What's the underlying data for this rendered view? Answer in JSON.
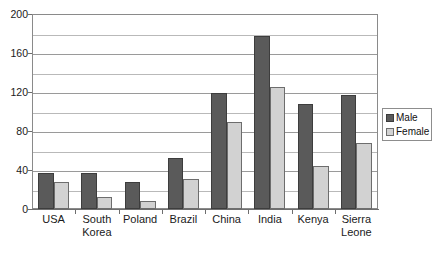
{
  "chart_data": {
    "type": "bar",
    "title": "",
    "subtitle": "",
    "xlabel": "",
    "ylabel": "",
    "ylim": [
      0,
      200
    ],
    "ytick_labels": [
      "0",
      "40",
      "80",
      "120",
      "160",
      "200"
    ],
    "ytick_values": [
      0,
      40,
      80,
      120,
      160,
      200
    ],
    "minor_gridline_values": [
      20,
      60,
      100,
      140,
      180
    ],
    "grid": true,
    "legend_position": "right",
    "categories": [
      "USA",
      "South Korea",
      "Poland",
      "Brazil",
      "China",
      "India",
      "Kenya",
      "Sierra Leone"
    ],
    "category_lines": [
      [
        "USA"
      ],
      [
        "South",
        "Korea"
      ],
      [
        "Poland"
      ],
      [
        "Brazil"
      ],
      [
        "China"
      ],
      [
        "India"
      ],
      [
        "Kenya"
      ],
      [
        "Sierra",
        "Leone"
      ]
    ],
    "series": [
      {
        "name": "Male",
        "color": "#5a5a5a",
        "values": [
          37,
          37,
          28,
          52,
          119,
          177,
          108,
          117
        ]
      },
      {
        "name": "Female",
        "color": "#d2d2d2",
        "values": [
          28,
          12,
          8,
          31,
          89,
          125,
          44,
          68
        ]
      }
    ]
  },
  "legend": {
    "items": [
      {
        "label": "Male",
        "swatch": "male"
      },
      {
        "label": "Female",
        "swatch": "female"
      }
    ]
  }
}
